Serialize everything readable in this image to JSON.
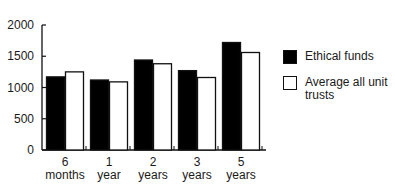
{
  "chart_data": {
    "type": "bar",
    "title": "",
    "xlabel": "",
    "ylabel": "",
    "categories": [
      "6 months",
      "1 year",
      "2 years",
      "3 years",
      "5 years"
    ],
    "category_lines": [
      [
        "6",
        "months"
      ],
      [
        "1",
        "year"
      ],
      [
        "2",
        "years"
      ],
      [
        "3",
        "years"
      ],
      [
        "5",
        "years"
      ]
    ],
    "series": [
      {
        "name": "Ethical funds",
        "values": [
          1170,
          1120,
          1440,
          1270,
          1720
        ],
        "fill": "#000000"
      },
      {
        "name": "Average all unit trusts",
        "values": [
          1250,
          1090,
          1380,
          1160,
          1560
        ],
        "fill": "#ffffff"
      }
    ],
    "ylim": [
      0,
      2000
    ],
    "yticks": [
      0,
      500,
      1000,
      1500,
      2000
    ],
    "grid": false,
    "legend_position": "right"
  },
  "legend": {
    "items": [
      {
        "label": "Ethical funds",
        "color": "#000000"
      },
      {
        "label": "Average all unit trusts",
        "color": "#ffffff"
      }
    ]
  }
}
